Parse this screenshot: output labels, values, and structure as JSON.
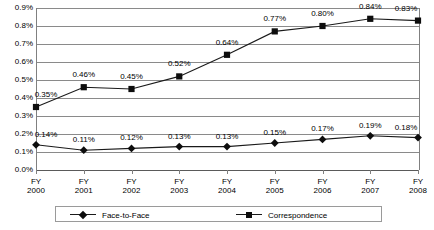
{
  "chart_data": {
    "type": "line",
    "title": "",
    "subtitle": "",
    "xlabel": "",
    "ylabel": "",
    "categories": [
      "FY 2000",
      "FY 2001",
      "FY 2002",
      "FY 2003",
      "FY 2004",
      "FY 2005",
      "FY 2006",
      "FY 2007",
      "FY 2008"
    ],
    "category_lines": [
      [
        "FY",
        "2000"
      ],
      [
        "FY",
        "2001"
      ],
      [
        "FY",
        "2002"
      ],
      [
        "FY",
        "2003"
      ],
      [
        "FY",
        "2004"
      ],
      [
        "FY",
        "2005"
      ],
      [
        "FY",
        "2006"
      ],
      [
        "FY",
        "2007"
      ],
      [
        "FY",
        "2008"
      ]
    ],
    "series": [
      {
        "name": "Face-to-Face",
        "marker": "diamond",
        "values": [
          0.14,
          0.11,
          0.12,
          0.13,
          0.13,
          0.15,
          0.17,
          0.19,
          0.18
        ],
        "labels": [
          "0.14%",
          "0.11%",
          "0.12%",
          "0.13%",
          "0.13%",
          "0.15%",
          "0.17%",
          "0.19%",
          "0.18%"
        ]
      },
      {
        "name": "Correspondence",
        "marker": "square",
        "values": [
          0.35,
          0.46,
          0.45,
          0.52,
          0.64,
          0.77,
          0.8,
          0.84,
          0.83
        ],
        "labels": [
          "0.35%",
          "0.46%",
          "0.45%",
          "0.52%",
          "0.64%",
          "0.77%",
          "0.80%",
          "0.84%",
          "0.83%"
        ]
      }
    ],
    "ylim": [
      0.0,
      0.9
    ],
    "ytick_values": [
      0.9,
      0.8,
      0.7,
      0.6,
      0.5,
      0.4,
      0.3,
      0.2,
      0.1,
      0.0
    ],
    "ytick_labels": [
      "0.9%",
      "0.8%",
      "0.7%",
      "0.6%",
      "0.5%",
      "0.4%",
      "0.3%",
      "0.2%",
      "0.1%",
      "0.0%"
    ],
    "grid": true,
    "legend_position": "bottom",
    "colors": {
      "line": "#1a1a1a",
      "marker": "#0d0d0d",
      "grid": "#8a8a8a",
      "axis": "#808080",
      "text": "#000000",
      "background": "#ffffff"
    }
  }
}
